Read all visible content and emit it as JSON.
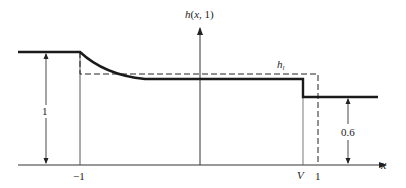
{
  "diagram": {
    "y_axis_label": "h(x, 1)",
    "x_axis_label": "x",
    "tick_labels": {
      "minus_one": "−1",
      "v": "V",
      "one": "1"
    },
    "dashed_label_main": "h",
    "dashed_label_sub": "l",
    "left_height_label": "1",
    "right_height_label": "0.6",
    "colors": {
      "line": "#1a1a1a",
      "thin": "#333333",
      "dash": "#222222"
    }
  }
}
